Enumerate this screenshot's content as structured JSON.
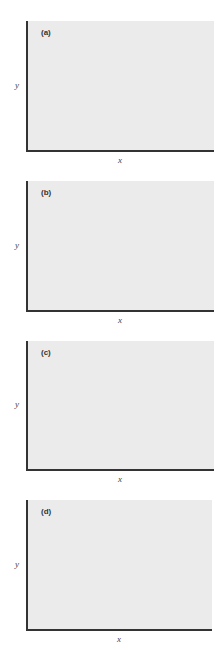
{
  "chart_data": [
    {
      "type": "scatter",
      "title": "(a)",
      "xlabel": "x",
      "ylabel": "y",
      "grid": false,
      "description": "strong positive linear correlation",
      "frame": {
        "top": 21,
        "bottom": 150,
        "left": 26,
        "right": 214
      },
      "points": [
        [
          52,
          111
        ],
        [
          52,
          131
        ],
        [
          64,
          115
        ],
        [
          71,
          106
        ],
        [
          72,
          89
        ],
        [
          93,
          82
        ],
        [
          93,
          66
        ],
        [
          101,
          59
        ],
        [
          109,
          48
        ],
        [
          111,
          61
        ]
      ],
      "fit_line": [
        [
          37,
          139
        ],
        [
          122,
          45
        ]
      ]
    },
    {
      "type": "scatter",
      "title": "(b)",
      "xlabel": "x",
      "ylabel": "y",
      "grid": false,
      "description": "strong negative linear correlation",
      "frame": {
        "top": 181,
        "bottom": 310,
        "left": 26,
        "right": 214
      },
      "points": [
        [
          44,
          224
        ],
        [
          51,
          214
        ],
        [
          63,
          226
        ],
        [
          76,
          255
        ],
        [
          90,
          252
        ],
        [
          89,
          266
        ],
        [
          106,
          267
        ],
        [
          117,
          278
        ],
        [
          118,
          295
        ]
      ],
      "fit_line": [
        [
          32,
          203
        ],
        [
          137,
          305
        ]
      ]
    },
    {
      "type": "scatter",
      "title": "(c)",
      "xlabel": "x",
      "ylabel": "y",
      "grid": false,
      "description": "weak positive correlation with large scatter",
      "frame": {
        "top": 341,
        "bottom": 469,
        "left": 26,
        "right": 214
      },
      "points": [
        [
          87,
          360
        ],
        [
          115,
          360
        ],
        [
          95,
          379
        ],
        [
          119,
          383
        ],
        [
          138,
          379
        ],
        [
          57,
          397
        ],
        [
          74,
          395
        ],
        [
          109,
          402
        ],
        [
          123,
          402
        ],
        [
          149,
          394
        ],
        [
          48,
          413
        ],
        [
          78,
          411
        ],
        [
          96,
          422
        ],
        [
          34,
          438
        ],
        [
          51,
          445
        ],
        [
          75,
          438
        ],
        [
          97,
          437
        ],
        [
          67,
          456
        ]
      ],
      "fit_line": [
        [
          34,
          454
        ],
        [
          140,
          357
        ]
      ]
    },
    {
      "type": "scatter",
      "title": "(d)",
      "xlabel": "x",
      "ylabel": "y",
      "grid": false,
      "description": "non-linear (curved) relationship with linear fit",
      "frame": {
        "top": 500,
        "bottom": 629,
        "left": 26,
        "right": 212
      },
      "points": [
        [
          155,
          522
        ],
        [
          160,
          532
        ],
        [
          131,
          527
        ],
        [
          106,
          532
        ],
        [
          120,
          537
        ],
        [
          94,
          543
        ],
        [
          63,
          552
        ],
        [
          77,
          552
        ],
        [
          45,
          565
        ],
        [
          60,
          565
        ],
        [
          35,
          584
        ],
        [
          44,
          584
        ],
        [
          36,
          600
        ]
      ],
      "fit_line": [
        [
          35,
          611
        ],
        [
          133,
          516
        ]
      ]
    }
  ],
  "style": {
    "plot_background": "#ebebeb",
    "axis_color": "#333333",
    "point_color": "#111111",
    "line_color": "#222222"
  }
}
